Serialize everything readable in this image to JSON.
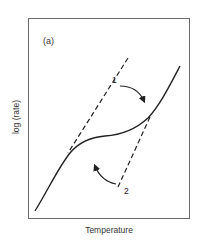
{
  "figure": {
    "panel_label": "(a)",
    "ylabel": "log (rate)",
    "xlabel": "Temperature",
    "markers": [
      {
        "id": "1",
        "label": "1"
      },
      {
        "id": "2",
        "label": "2"
      }
    ],
    "elements": {
      "curve": "solid S-shaped rate curve with plateau",
      "line1": "dashed line labelled 1 with arrow pointing down-right toward curve",
      "line2": "dashed line labelled 2 with arrow pointing up-left toward curve"
    },
    "colors": {
      "line": "#222222",
      "frame": "#6a6a6a",
      "background": "#ffffff"
    }
  }
}
